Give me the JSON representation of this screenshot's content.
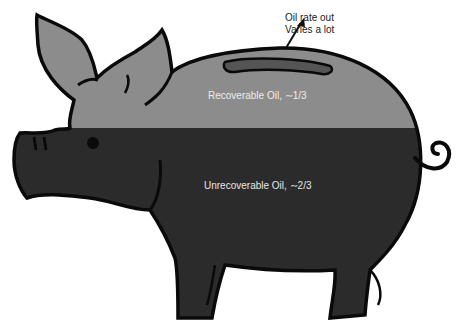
{
  "diagram": {
    "annotation": {
      "line1": "Oil rate out",
      "line2": "Varies a lot"
    },
    "regions": {
      "recoverable": {
        "label": "Recoverable Oil, ∼1/3",
        "color": "#8c8c8c"
      },
      "unrecoverable": {
        "label": "Unrecoverable Oil, ∼2/3",
        "color": "#2b2b2b"
      }
    },
    "outline_color": "#0a0a0a",
    "slot_color": "#555555"
  }
}
